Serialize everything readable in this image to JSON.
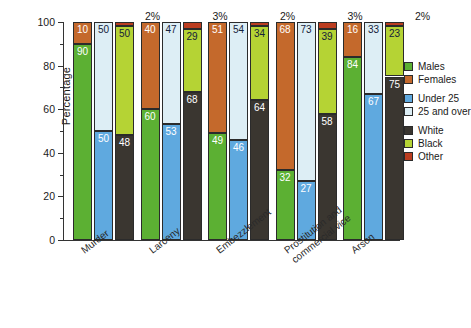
{
  "chart_data": {
    "type": "bar",
    "subtype": "stacked-percentage-grouped",
    "title": "",
    "xlabel": "",
    "ylabel": "Percentage",
    "ylim": [
      0,
      100
    ],
    "yticks": [
      0,
      20,
      40,
      60,
      80,
      100
    ],
    "ytick_minor": [
      10,
      30,
      50,
      70,
      90
    ],
    "grid": false,
    "legend_position": "right",
    "stack_total": 100,
    "units": "percent",
    "categories": [
      "Murder",
      "Larceny",
      "Embezzlement",
      "Prostitution and commercial vice",
      "Arson"
    ],
    "bar_groups": [
      {
        "name": "sex",
        "series": [
          "Males",
          "Females"
        ]
      },
      {
        "name": "age",
        "series": [
          "Under 25",
          "25 and over"
        ]
      },
      {
        "name": "race",
        "series": [
          "White",
          "Black",
          "Other"
        ]
      }
    ],
    "series": [
      {
        "name": "Males",
        "group": "sex",
        "color": "#5cb033",
        "values": [
          90,
          60,
          49,
          32,
          84
        ]
      },
      {
        "name": "Females",
        "group": "sex",
        "color": "#c4692c",
        "values": [
          10,
          40,
          51,
          68,
          16
        ]
      },
      {
        "name": "Under 25",
        "group": "age",
        "color": "#5fa9df",
        "values": [
          50,
          53,
          46,
          27,
          67
        ]
      },
      {
        "name": "25 and over",
        "group": "age",
        "color": "#ddeef5",
        "values": [
          50,
          47,
          54,
          73,
          33
        ]
      },
      {
        "name": "White",
        "group": "race",
        "color": "#3a3630",
        "values": [
          48,
          68,
          64,
          58,
          75
        ]
      },
      {
        "name": "Black",
        "group": "race",
        "color": "#b5d334",
        "values": [
          50,
          29,
          34,
          39,
          23
        ]
      },
      {
        "name": "Other",
        "group": "race",
        "color": "#bb3d20",
        "values": [
          2,
          3,
          2,
          3,
          2
        ]
      }
    ],
    "other_annotations": [
      "2%",
      "3%",
      "2%",
      "3%",
      "2%"
    ],
    "legend_entries": [
      {
        "label": "Males",
        "color": "#5cb033"
      },
      {
        "label": "Females",
        "color": "#c4692c"
      },
      {
        "label": "Under 25",
        "color": "#5fa9df"
      },
      {
        "label": "25 and over",
        "color": "#ddeef5"
      },
      {
        "label": "White",
        "color": "#3a3630"
      },
      {
        "label": "Black",
        "color": "#b5d334"
      },
      {
        "label": "Other",
        "color": "#bb3d20"
      }
    ],
    "axis_color": "#333333",
    "background": "#ffffff"
  }
}
